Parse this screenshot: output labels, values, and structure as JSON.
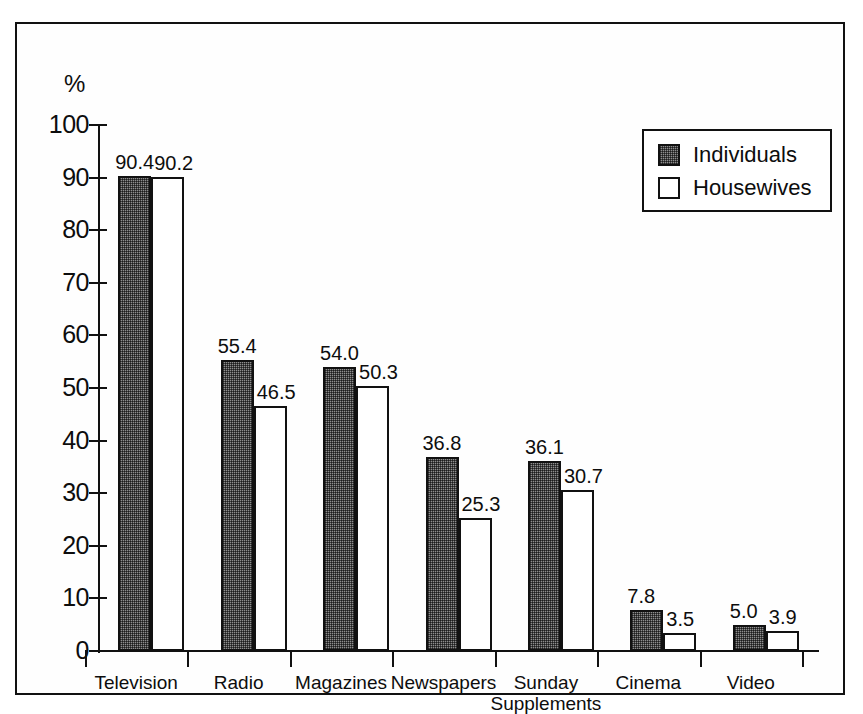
{
  "chart_data": {
    "type": "bar",
    "title": "",
    "xlabel": "",
    "ylabel": "%",
    "ylim": [
      0,
      100
    ],
    "ytick_step": 10,
    "yticks": [
      100,
      90,
      80,
      70,
      60,
      50,
      40,
      30,
      20,
      10,
      0
    ],
    "grid": false,
    "legend_position": "top-right",
    "categories": [
      "Television",
      "Radio",
      "Magazines",
      "Newspapers",
      "Sunday\nSupplements",
      "Cinema",
      "Video"
    ],
    "series": [
      {
        "name": "Individuals",
        "fill": "dotted-gray",
        "color": "#8e8e8e",
        "values": [
          90.4,
          55.4,
          54.0,
          36.8,
          36.1,
          7.8,
          5.0
        ],
        "value_labels": [
          "90.4",
          "55.4",
          "54.0",
          "36.8",
          "36.1",
          "7.8",
          "5.0"
        ]
      },
      {
        "name": "Housewives",
        "fill": "white",
        "color": "#ffffff",
        "values": [
          90.2,
          46.5,
          50.3,
          25.3,
          30.7,
          3.5,
          3.9
        ],
        "value_labels": [
          "90.2",
          "46.5",
          "50.3",
          "25.3",
          "30.7",
          "3.5",
          "3.9"
        ]
      }
    ]
  },
  "legend": {
    "items": [
      {
        "label": "Individuals"
      },
      {
        "label": "Housewives"
      }
    ]
  },
  "axis": {
    "y_unit_label": "%"
  },
  "colors": {
    "ink": "#111111",
    "background": "#ffffff",
    "series_individuals": "#8e8e8e",
    "series_housewives": "#ffffff"
  }
}
